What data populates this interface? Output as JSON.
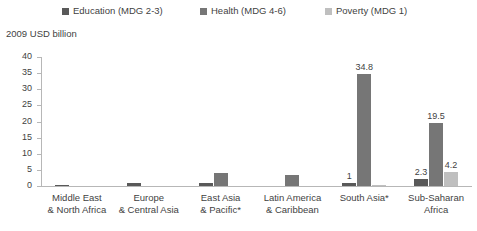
{
  "chart_data": {
    "type": "bar",
    "title": "",
    "ylabel": "2009 USD billion",
    "xlabel": "",
    "ylim": [
      0,
      40
    ],
    "yticks": [
      0,
      5,
      10,
      15,
      20,
      25,
      30,
      35,
      40
    ],
    "grid": false,
    "legend_position": "top",
    "categories": [
      "Middle East & North Africa",
      "Europe & Central Asia",
      "East Asia & Pacific*",
      "Latin America & Caribbean",
      "South Asia*",
      "Sub-Saharan Africa"
    ],
    "category_lines": [
      [
        "Middle East",
        "& North Africa"
      ],
      [
        "Europe",
        "& Central Asia"
      ],
      [
        "East Asia",
        "& Pacific*"
      ],
      [
        "Latin America",
        "& Caribbean"
      ],
      [
        "South Asia*",
        ""
      ],
      [
        "Sub-Saharan",
        "Africa"
      ]
    ],
    "series": [
      {
        "name": "Education (MDG 2-3)",
        "color": "#595959",
        "values": [
          0.3,
          0.8,
          1.0,
          0.0,
          1.0,
          2.3
        ],
        "labels": [
          "",
          "",
          "",
          "",
          "1",
          "2.3"
        ]
      },
      {
        "name": "Health (MDG 4-6)",
        "color": "#767676",
        "values": [
          0.0,
          0.0,
          4.0,
          3.3,
          34.8,
          19.5
        ],
        "labels": [
          "",
          "",
          "",
          "",
          "34.8",
          "19.5"
        ]
      },
      {
        "name": "Poverty (MDG 1)",
        "color": "#bfbfbf",
        "values": [
          0.0,
          0.0,
          0.0,
          0.0,
          0.4,
          4.2
        ],
        "labels": [
          "",
          "",
          "",
          "",
          "",
          "4.2"
        ]
      }
    ]
  },
  "legend": {
    "items": [
      {
        "label": "Education (MDG 2-3)",
        "color": "#595959"
      },
      {
        "label": "Health (MDG 4-6)",
        "color": "#767676"
      },
      {
        "label": "Poverty (MDG 1)",
        "color": "#bfbfbf"
      }
    ]
  },
  "axis": {
    "y_title": "2009 USD billion",
    "y_tick_labels": [
      "40",
      "35",
      "30",
      "25",
      "20",
      "15",
      "10",
      "5",
      "0"
    ]
  },
  "colors": {
    "axis": "#b7b7b7",
    "text": "#3f3f3f",
    "background": "#ffffff"
  }
}
